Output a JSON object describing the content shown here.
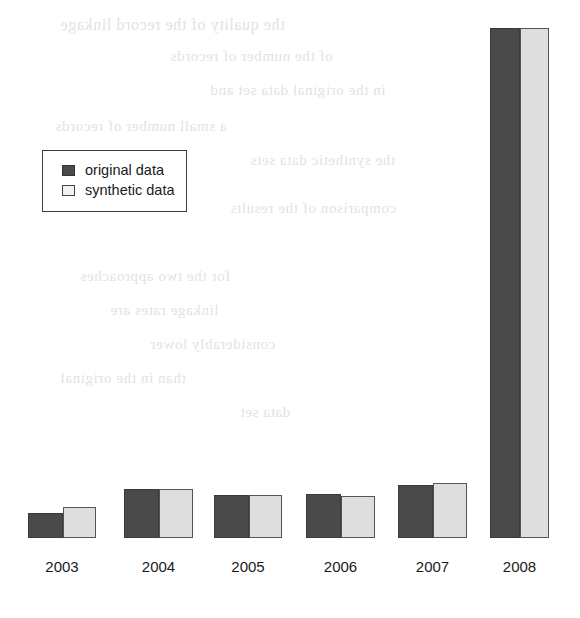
{
  "chart_data": {
    "type": "bar",
    "title": "",
    "subtitle": "",
    "xlabel": "",
    "ylabel": "",
    "grid": false,
    "legend_position": "upper-left",
    "categories": [
      "2003",
      "2004",
      "2005",
      "2006",
      "2007",
      "2008"
    ],
    "ylim": [
      0,
      100
    ],
    "series": [
      {
        "name": "original data",
        "color": "#4a4a4a",
        "values": [
          5.0,
          9.6,
          8.4,
          8.6,
          10.4,
          100.0
        ]
      },
      {
        "name": "synthetic data",
        "color": "#dedede",
        "values": [
          6.0,
          9.6,
          8.4,
          8.2,
          10.8,
          100.0
        ]
      }
    ]
  },
  "legend": {
    "items": [
      {
        "label": "original data",
        "swatch": "legend-swatch-dark"
      },
      {
        "label": "synthetic data",
        "swatch": "legend-swatch-light"
      }
    ]
  },
  "axis": {
    "x_tick_labels": [
      "2003",
      "2004",
      "2005",
      "2006",
      "2007",
      "2008"
    ]
  },
  "page": {
    "background_color": "#ffffff",
    "ghost_text_color": "#d9d9d9",
    "ghost_lines": [
      "the quality of the record linkage",
      "of the number of records",
      "in the original data set and",
      "a small number of records",
      "the synthetic data sets",
      "comparison of the results",
      "for the two approaches",
      "linkage rates are",
      "considerably lower",
      "than in the original",
      "data set"
    ]
  }
}
